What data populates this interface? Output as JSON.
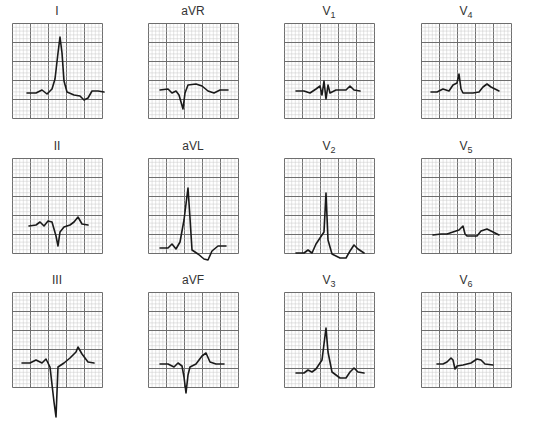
{
  "figure": {
    "grid": {
      "major_squares_x": 5,
      "major_squares_y": 5,
      "minor_per_major": 5,
      "minor_color": "#c8c8c8",
      "major_color": "#6e6e6e",
      "trace_color": "#1a1a1a"
    },
    "leads": [
      {
        "id": "I",
        "label": "I",
        "sub": "",
        "x": 12,
        "y": 4,
        "trace": "M15 70 L24 70 L30 67 L35 71 L40 66 L43 56 L46 30 L48 14 L50 30 L52 58 L55 69 L62 72 L68 73 L72 77 L76 75 L80 68 L86 68 L92 69"
      },
      {
        "id": "aVR",
        "label": "aVR",
        "sub": "",
        "x": 148,
        "y": 4,
        "trace": "M12 67 L20 66 L24 70 L28 68 L31 72 L35 86 L37 70 L40 62 L48 61 L54 63 L60 68 L66 70 L72 67 L80 67"
      },
      {
        "id": "V1",
        "label": "V",
        "sub": "1",
        "x": 284,
        "y": 4,
        "trace": "M12 68 L20 68 L26 70 L32 66 L36 63 L38 72 L40 58 L42 76 L44 62 L46 70 L52 67 L62 67 L66 63 L70 67 L76 68"
      },
      {
        "id": "V4",
        "label": "V",
        "sub": "4",
        "x": 421,
        "y": 4,
        "trace": "M10 69 L16 69 L22 66 L28 68 L32 62 L36 60 L38 51 L40 66 L42 70 L52 70 L58 69 L62 64 L66 61 L70 64 L78 68"
      },
      {
        "id": "II",
        "label": "II",
        "sub": "",
        "x": 12,
        "y": 139,
        "trace": "M17 68 L24 67 L28 64 L32 68 L36 63 L40 64 L44 78 L46 88 L48 74 L52 69 L58 67 L62 64 L66 59 L70 66 L76 67"
      },
      {
        "id": "aVL",
        "label": "aVL",
        "sub": "",
        "x": 148,
        "y": 139,
        "trace": "M12 90 L20 90 L24 86 L28 91 L32 84 L36 62 L40 30 L42 60 L44 92 L50 96 L56 101 L60 102 L64 93 L70 88 L78 88"
      },
      {
        "id": "V2",
        "label": "V",
        "sub": "2",
        "x": 284,
        "y": 139,
        "trace": "M12 95 L20 95 L24 92 L28 95 L32 86 L40 74 L42 35 L44 82 L48 96 L56 100 L62 100 L66 93 L70 87 L74 91 L80 95"
      },
      {
        "id": "V5",
        "label": "V",
        "sub": "5",
        "x": 421,
        "y": 139,
        "trace": "M12 77 L20 76 L26 76 L32 74 L38 72 L42 68 L44 76 L46 78 L56 78 L60 73 L66 71 L72 74 L78 77"
      },
      {
        "id": "III",
        "label": "III",
        "sub": "",
        "x": 12,
        "y": 273,
        "trace": "M10 71 L18 71 L24 68 L30 71 L34 67 L38 75 L42 110 L44 125 L46 75 L52 71 L58 66 L64 60 L66 55 L70 62 L76 70 L82 71"
      },
      {
        "id": "aVF",
        "label": "aVF",
        "sub": "",
        "x": 148,
        "y": 273,
        "trace": "M12 72 L20 72 L26 75 L30 71 L34 74 L36 85 L38 101 L40 83 L42 75 L48 72 L54 64 L58 61 L62 70 L68 72 L76 72"
      },
      {
        "id": "V3",
        "label": "V",
        "sub": "3",
        "x": 284,
        "y": 273,
        "trace": "M12 81 L20 81 L24 78 L28 80 L32 77 L38 68 L42 36 L44 60 L48 80 L56 86 L62 86 L66 80 L70 76 L74 80 L80 81"
      },
      {
        "id": "V6",
        "label": "V",
        "sub": "6",
        "x": 421,
        "y": 273,
        "trace": "M16 72 L22 72 L26 70 L30 66 L32 68 L34 77 L36 74 L42 73 L50 71 L56 67 L60 68 L64 72 L72 73"
      }
    ]
  }
}
